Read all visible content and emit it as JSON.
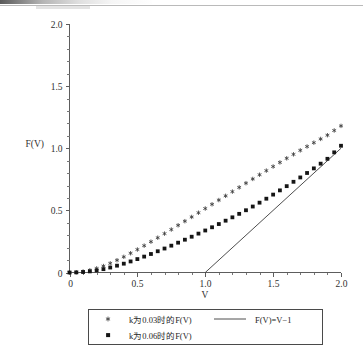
{
  "figure": {
    "background": "#ffffff",
    "ink_color": "#30302f",
    "artifact_note": "scan-smudge-top-edge"
  },
  "axes": {
    "x": {
      "label": "V",
      "min": 0,
      "max": 2.0,
      "major_ticks": [
        0,
        0.5,
        1.0,
        1.5,
        2.0
      ],
      "major_tick_labels": [
        "0",
        "0.5",
        "1.0",
        "1.5",
        "2.0"
      ],
      "minor_tick_step": 0.1
    },
    "y": {
      "label": "F(V)",
      "min": 0,
      "max": 2.0,
      "major_ticks": [
        0,
        0.5,
        1.0,
        1.5,
        2.0
      ],
      "major_tick_labels": [
        "0",
        "0.5",
        "1.0",
        "1.5",
        "2.0"
      ],
      "minor_tick_step": 0.1
    }
  },
  "legend": {
    "entries": [
      {
        "marker": "star-marker",
        "label": "k为0.03时的F(V)"
      },
      {
        "marker": "square-marker",
        "label": "k为0.06时的F(V)"
      },
      {
        "marker": "line-marker",
        "label": "F(V)=V−1"
      }
    ]
  },
  "chart_data": {
    "type": "scatter",
    "title": "",
    "xlabel": "V",
    "ylabel": "F(V)",
    "xlim": [
      0,
      2.0
    ],
    "ylim": [
      0,
      2.0
    ],
    "grid": false,
    "legend_position": "below-axes",
    "series": [
      {
        "name": "k为0.03时的F(V)",
        "marker": "star",
        "color": "#3c3c3c",
        "x": [
          0.0,
          0.05,
          0.1,
          0.15,
          0.2,
          0.25,
          0.3,
          0.35,
          0.4,
          0.45,
          0.5,
          0.55,
          0.6,
          0.65,
          0.7,
          0.75,
          0.8,
          0.85,
          0.9,
          0.95,
          1.0,
          1.05,
          1.1,
          1.15,
          1.2,
          1.25,
          1.3,
          1.35,
          1.4,
          1.45,
          1.5,
          1.55,
          1.6,
          1.65,
          1.7,
          1.75,
          1.8,
          1.85,
          1.9,
          1.95,
          2.0
        ],
        "y": [
          0.0,
          0.002,
          0.008,
          0.018,
          0.033,
          0.052,
          0.074,
          0.099,
          0.126,
          0.155,
          0.185,
          0.216,
          0.248,
          0.28,
          0.313,
          0.346,
          0.38,
          0.413,
          0.447,
          0.481,
          0.515,
          0.549,
          0.583,
          0.617,
          0.651,
          0.685,
          0.719,
          0.753,
          0.787,
          0.82,
          0.853,
          0.886,
          0.919,
          0.951,
          0.983,
          1.014,
          1.045,
          1.075,
          1.105,
          1.143,
          1.18
        ]
      },
      {
        "name": "k为0.06时的F(V)",
        "marker": "square",
        "color": "#151515",
        "x": [
          0.0,
          0.05,
          0.1,
          0.15,
          0.2,
          0.25,
          0.3,
          0.35,
          0.4,
          0.45,
          0.5,
          0.55,
          0.6,
          0.65,
          0.7,
          0.75,
          0.8,
          0.85,
          0.9,
          0.95,
          1.0,
          1.05,
          1.1,
          1.15,
          1.2,
          1.25,
          1.3,
          1.35,
          1.4,
          1.45,
          1.5,
          1.55,
          1.6,
          1.65,
          1.7,
          1.75,
          1.8,
          1.85,
          1.9,
          1.95,
          2.0
        ],
        "y": [
          0.0,
          0.001,
          0.004,
          0.009,
          0.017,
          0.027,
          0.04,
          0.055,
          0.071,
          0.089,
          0.108,
          0.128,
          0.149,
          0.171,
          0.193,
          0.216,
          0.24,
          0.264,
          0.288,
          0.313,
          0.338,
          0.364,
          0.39,
          0.417,
          0.444,
          0.472,
          0.501,
          0.531,
          0.562,
          0.594,
          0.627,
          0.661,
          0.695,
          0.73,
          0.765,
          0.801,
          0.838,
          0.876,
          0.915,
          0.967,
          1.02
        ]
      },
      {
        "name": "F(V)=V−1",
        "marker": "line",
        "color": "#3a3a3a",
        "x": [
          1.0,
          2.0
        ],
        "y": [
          0.0,
          1.0
        ]
      }
    ]
  }
}
